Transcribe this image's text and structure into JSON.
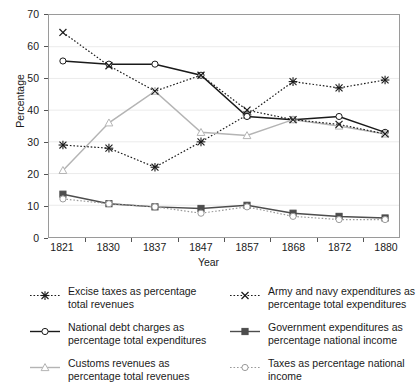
{
  "chart_data": {
    "type": "line",
    "title": "",
    "xlabel": "Year",
    "ylabel": "Percentage",
    "categories": [
      "1821",
      "1830",
      "1837",
      "1847",
      "1857",
      "1868",
      "1872",
      "1880"
    ],
    "ylim": [
      0,
      70
    ],
    "yticks": [
      0,
      10,
      20,
      30,
      40,
      50,
      60,
      70
    ],
    "grid": true,
    "legend_position": "below-two-columns",
    "series": [
      {
        "name": "Excise taxes as percentage total revenues",
        "marker": "asterisk",
        "line_style": "dotted",
        "color": "#1a1a1a",
        "values": [
          29,
          28,
          22,
          30,
          38.5,
          49,
          47,
          49.5
        ]
      },
      {
        "name": "National debt charges as percentage total expenditures",
        "marker": "circle-open",
        "line_style": "solid",
        "color": "#1a1a1a",
        "values": [
          55.5,
          54.5,
          54.5,
          51,
          38,
          37,
          38,
          33
        ]
      },
      {
        "name": "Customs revenues as percentage total revenues",
        "marker": "triangle-open",
        "line_style": "solid",
        "color": "#b4b4b4",
        "values": [
          21,
          36,
          46,
          33,
          32,
          37,
          35,
          32.5
        ]
      },
      {
        "name": "Army and navy expenditures as percentage total expenditures",
        "marker": "cross",
        "line_style": "dotted",
        "color": "#1a1a1a",
        "values": [
          64.5,
          54,
          46,
          51,
          40,
          37,
          35.5,
          32.5
        ]
      },
      {
        "name": "Government expenditures as percentage national income",
        "marker": "square-filled",
        "line_style": "solid",
        "color": "#4d4d4d",
        "values": [
          13.5,
          10.5,
          9.5,
          9,
          10,
          7.5,
          6.5,
          6
        ]
      },
      {
        "name": "Taxes as percentage national income",
        "marker": "circle-open",
        "line_style": "dotted",
        "color": "#9a9a9a",
        "values": [
          12,
          10.5,
          9.5,
          7.5,
          9.5,
          6.5,
          5.5,
          5.5
        ]
      }
    ]
  },
  "axes": {
    "y_label": "Percentage",
    "x_label": "Year",
    "y_ticks": [
      "0",
      "10",
      "20",
      "30",
      "40",
      "50",
      "60",
      "70"
    ],
    "x_ticks": [
      "1821",
      "1830",
      "1837",
      "1847",
      "1857",
      "1868",
      "1872",
      "1880"
    ]
  },
  "legend": {
    "items": [
      {
        "label": "Excise taxes as percentage\ntotal revenues",
        "icon": "dotted-asterisk-marker-icon"
      },
      {
        "label": "Army and navy expenditures as\npercentage total expenditures",
        "icon": "dotted-cross-marker-icon"
      },
      {
        "label": "National debt charges as\npercentage total expenditures",
        "icon": "solid-circle-marker-icon"
      },
      {
        "label": "Government expenditures as\npercentage national income",
        "icon": "solid-square-marker-icon"
      },
      {
        "label": "Customs revenues as\npercentage total revenues",
        "icon": "dotted-triangle-marker-icon"
      },
      {
        "label": "Taxes as percentage national\nincome",
        "icon": "dotted-circle-marker-icon"
      }
    ]
  }
}
